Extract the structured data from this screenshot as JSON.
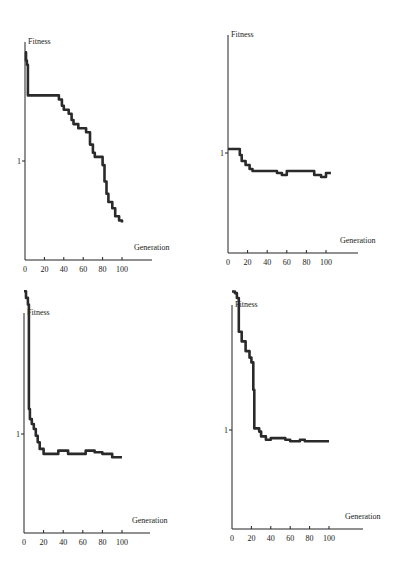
{
  "chart_data": [
    {
      "type": "line",
      "title": "",
      "ylabel": "Fitness",
      "xlabel": "Generation",
      "x_ticks": [
        "0",
        "20",
        "40",
        "60",
        "80",
        "100"
      ],
      "y_ticks": [
        "1"
      ],
      "xlim": [
        0,
        125
      ],
      "grid": false,
      "series": [
        {
          "name": "fitness",
          "x": [
            0,
            1,
            2,
            3,
            28,
            35,
            38,
            40,
            45,
            48,
            50,
            55,
            63,
            67,
            70,
            72,
            80,
            82,
            84,
            86,
            90,
            93,
            97,
            100
          ],
          "y": [
            1.53,
            1.49,
            1.47,
            1.32,
            1.32,
            1.3,
            1.27,
            1.25,
            1.23,
            1.2,
            1.18,
            1.16,
            1.14,
            1.08,
            1.04,
            1.02,
            0.98,
            0.9,
            0.84,
            0.8,
            0.77,
            0.73,
            0.71,
            0.7
          ]
        }
      ]
    },
    {
      "type": "line",
      "title": "",
      "ylabel": "Fitness",
      "xlabel": "Generation",
      "x_ticks": [
        "0",
        "20",
        "40",
        "60",
        "80",
        "100"
      ],
      "y_ticks": [
        "1"
      ],
      "xlim": [
        0,
        125
      ],
      "grid": false,
      "series": [
        {
          "name": "fitness",
          "x": [
            0,
            10,
            12,
            14,
            18,
            22,
            25,
            45,
            50,
            55,
            60,
            85,
            88,
            95,
            100,
            105
          ],
          "y": [
            1.02,
            1.02,
            0.99,
            0.96,
            0.94,
            0.92,
            0.91,
            0.91,
            0.9,
            0.89,
            0.91,
            0.91,
            0.89,
            0.88,
            0.9,
            0.9
          ]
        }
      ]
    },
    {
      "type": "line",
      "title": "",
      "ylabel": "Fitness",
      "xlabel": "Generation",
      "x_ticks": [
        "0",
        "20",
        "40",
        "60",
        "80",
        "100"
      ],
      "y_ticks": [
        "1"
      ],
      "xlim": [
        0,
        125
      ],
      "grid": false,
      "series": [
        {
          "name": "fitness",
          "x": [
            0,
            2,
            4,
            5,
            6,
            8,
            10,
            12,
            14,
            16,
            20,
            30,
            35,
            42,
            45,
            60,
            63,
            68,
            72,
            80,
            90,
            100
          ],
          "y": [
            1.86,
            1.82,
            1.78,
            1.15,
            1.09,
            1.06,
            1.03,
            0.99,
            0.95,
            0.91,
            0.88,
            0.88,
            0.9,
            0.9,
            0.88,
            0.88,
            0.9,
            0.9,
            0.89,
            0.88,
            0.86,
            0.86
          ]
        }
      ]
    },
    {
      "type": "line",
      "title": "",
      "ylabel": "Fitness",
      "xlabel": "Generation",
      "x_ticks": [
        "0",
        "20",
        "40",
        "60",
        "80",
        "100"
      ],
      "y_ticks": [
        "1"
      ],
      "xlim": [
        0,
        125
      ],
      "grid": false,
      "series": [
        {
          "name": "fitness",
          "x": [
            0,
            3,
            5,
            7,
            10,
            14,
            18,
            20,
            22,
            23,
            28,
            30,
            35,
            40,
            50,
            55,
            60,
            70,
            75,
            80,
            100
          ],
          "y": [
            1.86,
            1.85,
            1.82,
            1.61,
            1.55,
            1.49,
            1.45,
            1.42,
            1.25,
            1.01,
            0.99,
            0.96,
            0.94,
            0.95,
            0.95,
            0.94,
            0.93,
            0.94,
            0.93,
            0.93,
            0.93
          ]
        }
      ]
    }
  ],
  "panels": [
    {
      "ylabel": "Fitness",
      "xlabel": "Generation",
      "ytick": "1",
      "xticks": [
        "0",
        "20",
        "40",
        "60",
        "80",
        "100"
      ]
    },
    {
      "ylabel": "Fitness",
      "xlabel": "Generation",
      "ytick": "1",
      "xticks": [
        "0",
        "20",
        "40",
        "60",
        "80",
        "100"
      ]
    },
    {
      "ylabel": "Fitness",
      "xlabel": "Generation",
      "ytick": "1",
      "xticks": [
        "0",
        "20",
        "40",
        "60",
        "80",
        "100"
      ]
    },
    {
      "ylabel": "Fitness",
      "xlabel": "Generation",
      "ytick": "1",
      "xticks": [
        "0",
        "20",
        "40",
        "60",
        "80",
        "100"
      ]
    }
  ],
  "colors": {
    "line": "#2a2a2a",
    "axis": "#222222",
    "background": "#ffffff"
  }
}
